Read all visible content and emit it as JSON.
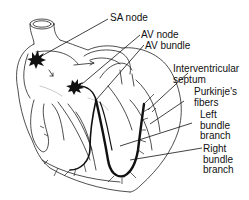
{
  "diagram": {
    "labels": {
      "sa_node": "SA node",
      "av_node": "AV node",
      "av_bundle": "AV bundle",
      "interventricular_septum": "Interventricular\nseptum",
      "purkinje_fibers": "Purkinje's\nfibers",
      "left_bundle_branch": "Left\nbundle\nbranch",
      "right_bundle_branch": "Right\nbundle\nbranch"
    },
    "colors": {
      "line": "#111111",
      "background": "#ffffff"
    }
  }
}
